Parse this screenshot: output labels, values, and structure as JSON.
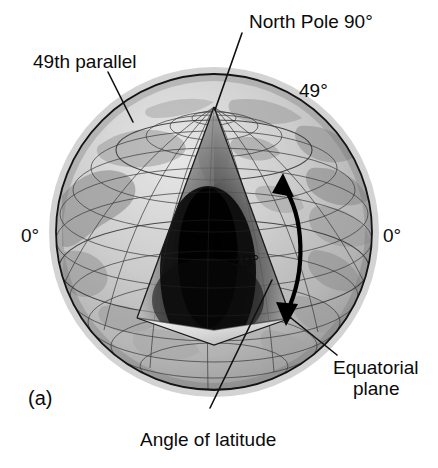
{
  "figure": {
    "panel_letter": "(a)",
    "title_topic": "angle-of-latitude-globe-diagram",
    "labels": {
      "north_pole": "North Pole 90°",
      "parallel_49": "49th parallel",
      "angle_49_right": "49°",
      "angle_49_inner": "49°",
      "equator_left": "0°",
      "equator_right": "0°",
      "equatorial_plane_line1": "Equatorial",
      "equatorial_plane_line2": "plane",
      "angle_of_latitude": "Angle of latitude"
    },
    "colors": {
      "background": "#ffffff",
      "ink": "#0b0b0b",
      "graticule": "#2f2f2f",
      "globe_outline": "#141414",
      "ocean_light": "#c9c9c9",
      "land_mid": "#a6a6a6",
      "wedge_dark": "#121212",
      "wedge_light": "#e8e8e8"
    },
    "geometry": {
      "globe_center_x": 214,
      "globe_center_y": 232,
      "globe_radius": 158,
      "north_pole_x": 214,
      "north_pole_y": 107,
      "latitude_angle_degrees": 49,
      "pole_latitude_degrees": 90,
      "equator_latitude_degrees": 0
    }
  }
}
